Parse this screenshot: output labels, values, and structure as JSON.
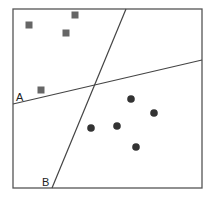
{
  "diagram": {
    "type": "linear-classifier-decision-boundaries",
    "frame": {
      "x": 13,
      "y": 9,
      "width": 189,
      "height": 179,
      "stroke": "#555555"
    },
    "lines": [
      {
        "label": "A",
        "x1": 13,
        "y1": 104,
        "x2": 202,
        "y2": 60,
        "label_x": 16,
        "label_y": 101
      },
      {
        "label": "B",
        "x1": 126,
        "y1": 9,
        "x2": 52,
        "y2": 188,
        "label_x": 42,
        "label_y": 186
      }
    ],
    "class_squares": {
      "color": "#666666",
      "points": [
        [
          29,
          25
        ],
        [
          75,
          15
        ],
        [
          66,
          33
        ],
        [
          41,
          90
        ]
      ]
    },
    "class_circles": {
      "color": "#333333",
      "points": [
        [
          131,
          99
        ],
        [
          154,
          113
        ],
        [
          91,
          128
        ],
        [
          117,
          126
        ],
        [
          136,
          147
        ]
      ]
    }
  }
}
